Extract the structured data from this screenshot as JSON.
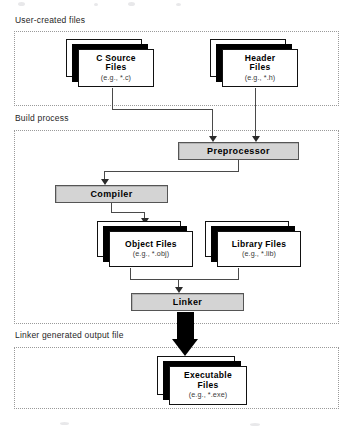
{
  "diagram": {
    "sections": [
      {
        "id": "user-created",
        "label": "User-created files"
      },
      {
        "id": "build-process",
        "label": "Build process"
      },
      {
        "id": "linker-output",
        "label": "Linker generated output file"
      }
    ],
    "file_nodes": [
      {
        "id": "c-source-files",
        "title": "C Source",
        "title2": "Files",
        "subtitle": "(e.g., *.c)"
      },
      {
        "id": "header-files",
        "title": "Header",
        "title2": "Files",
        "subtitle": "(e.g., *.h)"
      },
      {
        "id": "object-files",
        "title": "Object Files",
        "title2": "",
        "subtitle": "(e.g., *.obj)"
      },
      {
        "id": "library-files",
        "title": "Library Files",
        "title2": "",
        "subtitle": "(e.g., *.lib)"
      },
      {
        "id": "executable-files",
        "title": "Executable",
        "title2": "Files",
        "subtitle": "(e.g., *.exe)"
      }
    ],
    "process_nodes": [
      {
        "id": "preprocessor",
        "label": "Preprocessor"
      },
      {
        "id": "compiler",
        "label": "Compiler"
      },
      {
        "id": "linker",
        "label": "Linker"
      }
    ],
    "colors": {
      "process_fill": "#d4d4d4",
      "process_border": "#555555",
      "section_border": "#9a9a9a",
      "connector": "#4a4a4a",
      "sheet_shadow": "#000000",
      "background": "#ffffff"
    }
  }
}
